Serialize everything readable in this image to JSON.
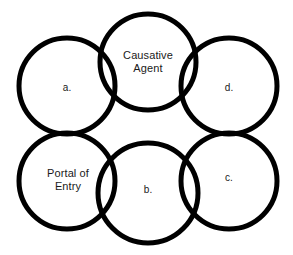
{
  "diagram": {
    "background_color": "#ffffff",
    "stroke_color": "#000000",
    "text_color": "#1a1a1a",
    "circles": [
      {
        "id": "causative-agent",
        "label": "Causative\nAgent",
        "position": "top-center",
        "cx": 148,
        "cy": 62,
        "r": 48
      },
      {
        "id": "a",
        "label": "a.",
        "position": "top-left",
        "cx": 67,
        "cy": 86,
        "r": 48
      },
      {
        "id": "d",
        "label": "d.",
        "position": "top-right",
        "cx": 229,
        "cy": 86,
        "r": 48
      },
      {
        "id": "portal-of-entry",
        "label": "Portal of\nEntry",
        "position": "bottom-left",
        "cx": 67,
        "cy": 181,
        "r": 48
      },
      {
        "id": "b",
        "label": "b.",
        "position": "bottom-center",
        "cx": 148,
        "cy": 193,
        "r": 50
      },
      {
        "id": "c",
        "label": "c.",
        "position": "bottom-right",
        "cx": 229,
        "cy": 181,
        "r": 48
      }
    ]
  }
}
